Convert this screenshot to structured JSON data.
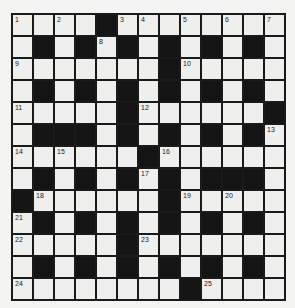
{
  "puzzle": {
    "rows": 13,
    "cols": 13,
    "colors": {
      "block": "#141414",
      "cell": "#efefed",
      "line": "#1a1a1a",
      "background": "#f4f4f2"
    },
    "grid": [
      "....#........",
      ".#.#.#.#.#.#.",
      ".......#.....",
      ".#.#.#.#.#.#.",
      ".....#......#",
      ".###.#.#.#.#.",
      "......#......",
      ".#.#.#.#.###.",
      "#......#.....",
      ".#.#.#.#.#.#.",
      ".....#.......",
      ".#.#.#.#.#.#.",
      "........#...."
    ],
    "numbers": [
      {
        "r": 0,
        "c": 0,
        "n": "1"
      },
      {
        "r": 0,
        "c": 2,
        "n": "2"
      },
      {
        "r": 0,
        "c": 5,
        "n": "3"
      },
      {
        "r": 0,
        "c": 6,
        "n": "4"
      },
      {
        "r": 0,
        "c": 8,
        "n": "5"
      },
      {
        "r": 0,
        "c": 10,
        "n": "6"
      },
      {
        "r": 0,
        "c": 12,
        "n": "7"
      },
      {
        "r": 1,
        "c": 4,
        "n": "8"
      },
      {
        "r": 2,
        "c": 0,
        "n": "9"
      },
      {
        "r": 2,
        "c": 8,
        "n": "10"
      },
      {
        "r": 4,
        "c": 0,
        "n": "11"
      },
      {
        "r": 4,
        "c": 6,
        "n": "12"
      },
      {
        "r": 5,
        "c": 12,
        "n": "13"
      },
      {
        "r": 6,
        "c": 0,
        "n": "14"
      },
      {
        "r": 6,
        "c": 2,
        "n": "15"
      },
      {
        "r": 6,
        "c": 7,
        "n": "16"
      },
      {
        "r": 7,
        "c": 6,
        "n": "17"
      },
      {
        "r": 8,
        "c": 1,
        "n": "18"
      },
      {
        "r": 8,
        "c": 8,
        "n": "19"
      },
      {
        "r": 8,
        "c": 10,
        "n": "20"
      },
      {
        "r": 9,
        "c": 0,
        "n": "21"
      },
      {
        "r": 10,
        "c": 0,
        "n": "22"
      },
      {
        "r": 10,
        "c": 6,
        "n": "23"
      },
      {
        "r": 12,
        "c": 0,
        "n": "24"
      },
      {
        "r": 12,
        "c": 9,
        "n": "25"
      }
    ]
  }
}
